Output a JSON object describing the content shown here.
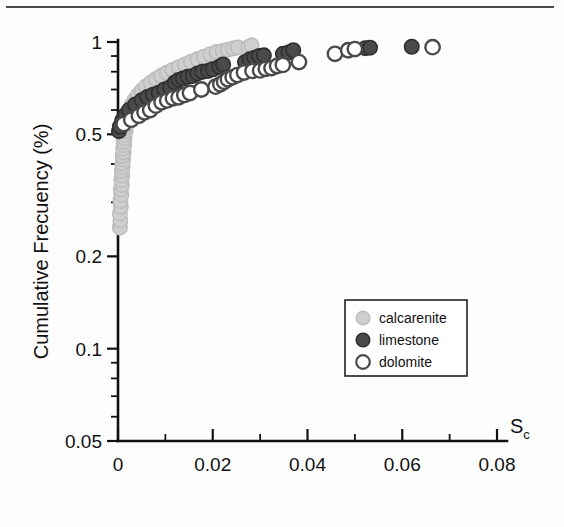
{
  "figure": {
    "background_color": "#fdfdfd",
    "top_rule_color": "#4a4a4a",
    "axis_color": "#111111"
  },
  "chart_data": {
    "type": "scatter",
    "title": "",
    "subtitle": "",
    "xlabel": "S",
    "xlabel_sub": "c",
    "ylabel": "Cumulative Frecuency (%)",
    "xlim": [
      0,
      0.08
    ],
    "ylim": [
      0.05,
      1
    ],
    "yscale": "log",
    "xscale": "linear",
    "grid": false,
    "legend_position": "center-right",
    "x_ticks": [
      0,
      0.02,
      0.04,
      0.06,
      0.08
    ],
    "x_tick_labels": [
      "0",
      "0.02",
      "0.04",
      "0.06",
      "0.08"
    ],
    "x_minor_ticks": [
      0.01,
      0.03,
      0.05,
      0.07
    ],
    "y_ticks": [
      1,
      0.5,
      0.2,
      0.1,
      0.05
    ],
    "y_tick_labels": [
      "1",
      "0.5",
      "0.2",
      "0.1",
      "0.05"
    ],
    "y_minor_ticks": [
      0.9,
      0.8,
      0.7,
      0.6,
      0.4,
      0.3,
      0.09,
      0.08,
      0.07,
      0.06
    ],
    "legend": [
      {
        "name": "calcarenite",
        "marker": "filled-circle",
        "color": "#cfcfcf",
        "edge": "#bdbdbd"
      },
      {
        "name": "limestone",
        "marker": "filled-circle",
        "color": "#4a4a4a",
        "edge": "#2e2e2e"
      },
      {
        "name": "dolomite",
        "marker": "open-circle",
        "color": "#ffffff",
        "edge": "#4a4a4a"
      }
    ],
    "series": [
      {
        "name": "calcarenite",
        "marker": "filled-circle",
        "color": "#cfcfcf",
        "edge": "#bdbdbd",
        "points": [
          [
            0.0004,
            0.248
          ],
          [
            0.0005,
            0.262
          ],
          [
            0.0004,
            0.276
          ],
          [
            0.0006,
            0.29
          ],
          [
            0.0005,
            0.303
          ],
          [
            0.0007,
            0.317
          ],
          [
            0.0006,
            0.33
          ],
          [
            0.0008,
            0.342
          ],
          [
            0.0007,
            0.355
          ],
          [
            0.0009,
            0.367
          ],
          [
            0.0008,
            0.379
          ],
          [
            0.001,
            0.391
          ],
          [
            0.0009,
            0.402
          ],
          [
            0.0011,
            0.414
          ],
          [
            0.001,
            0.425
          ],
          [
            0.0012,
            0.437
          ],
          [
            0.0011,
            0.449
          ],
          [
            0.0013,
            0.461
          ],
          [
            0.0012,
            0.473
          ],
          [
            0.0014,
            0.486
          ],
          [
            0.0013,
            0.498
          ],
          [
            0.0016,
            0.512
          ],
          [
            0.0015,
            0.524
          ],
          [
            0.0018,
            0.537
          ],
          [
            0.0017,
            0.55
          ],
          [
            0.0021,
            0.563
          ],
          [
            0.002,
            0.575
          ],
          [
            0.0025,
            0.588
          ],
          [
            0.0024,
            0.6
          ],
          [
            0.003,
            0.613
          ],
          [
            0.0029,
            0.624
          ],
          [
            0.0036,
            0.637
          ],
          [
            0.0035,
            0.648
          ],
          [
            0.0043,
            0.66
          ],
          [
            0.0042,
            0.671
          ],
          [
            0.0051,
            0.683
          ],
          [
            0.005,
            0.694
          ],
          [
            0.006,
            0.706
          ],
          [
            0.0059,
            0.716
          ],
          [
            0.007,
            0.727
          ],
          [
            0.0069,
            0.737
          ],
          [
            0.0081,
            0.748
          ],
          [
            0.008,
            0.757
          ],
          [
            0.0092,
            0.767
          ],
          [
            0.0091,
            0.776
          ],
          [
            0.0104,
            0.786
          ],
          [
            0.0103,
            0.794
          ],
          [
            0.0116,
            0.803
          ],
          [
            0.0115,
            0.811
          ],
          [
            0.0129,
            0.82
          ],
          [
            0.0128,
            0.828
          ],
          [
            0.0142,
            0.837
          ],
          [
            0.0141,
            0.845
          ],
          [
            0.0155,
            0.854
          ],
          [
            0.0154,
            0.862
          ],
          [
            0.0169,
            0.871
          ],
          [
            0.0168,
            0.879
          ],
          [
            0.0182,
            0.888
          ],
          [
            0.0181,
            0.896
          ],
          [
            0.0196,
            0.905
          ],
          [
            0.0195,
            0.912
          ],
          [
            0.0209,
            0.92
          ],
          [
            0.0208,
            0.927
          ],
          [
            0.0221,
            0.935
          ],
          [
            0.0232,
            0.944
          ],
          [
            0.0243,
            0.952
          ],
          [
            0.0253,
            0.96
          ],
          [
            0.0275,
            0.962
          ],
          [
            0.0282,
            0.975
          ]
        ]
      },
      {
        "name": "limestone",
        "marker": "filled-circle",
        "color": "#4a4a4a",
        "edge": "#2e2e2e",
        "points": [
          [
            0.0002,
            0.512
          ],
          [
            0.0004,
            0.53
          ],
          [
            0.0009,
            0.556
          ],
          [
            0.0016,
            0.58
          ],
          [
            0.0023,
            0.6
          ],
          [
            0.0036,
            0.625
          ],
          [
            0.005,
            0.646
          ],
          [
            0.0062,
            0.662
          ],
          [
            0.0074,
            0.673
          ],
          [
            0.0086,
            0.683
          ],
          [
            0.0098,
            0.7
          ],
          [
            0.011,
            0.712
          ],
          [
            0.012,
            0.738
          ],
          [
            0.0128,
            0.752
          ],
          [
            0.0137,
            0.76
          ],
          [
            0.0147,
            0.77
          ],
          [
            0.0158,
            0.775
          ],
          [
            0.0168,
            0.79
          ],
          [
            0.0178,
            0.8
          ],
          [
            0.019,
            0.805
          ],
          [
            0.02,
            0.815
          ],
          [
            0.0214,
            0.83
          ],
          [
            0.0222,
            0.845
          ],
          [
            0.0268,
            0.86
          ],
          [
            0.0278,
            0.878
          ],
          [
            0.0288,
            0.888
          ],
          [
            0.0298,
            0.9
          ],
          [
            0.0308,
            0.905
          ],
          [
            0.0348,
            0.915
          ],
          [
            0.036,
            0.925
          ],
          [
            0.037,
            0.94
          ],
          [
            0.0522,
            0.955
          ],
          [
            0.0532,
            0.958
          ],
          [
            0.062,
            0.965
          ]
        ]
      },
      {
        "name": "dolomite",
        "marker": "open-circle",
        "color": "#ffffff",
        "edge": "#4a4a4a",
        "points": [
          [
            0.0012,
            0.54
          ],
          [
            0.0028,
            0.558
          ],
          [
            0.0044,
            0.575
          ],
          [
            0.0056,
            0.59
          ],
          [
            0.0068,
            0.6
          ],
          [
            0.008,
            0.62
          ],
          [
            0.0092,
            0.636
          ],
          [
            0.0104,
            0.645
          ],
          [
            0.0116,
            0.655
          ],
          [
            0.0128,
            0.66
          ],
          [
            0.014,
            0.672
          ],
          [
            0.0152,
            0.682
          ],
          [
            0.0176,
            0.7
          ],
          [
            0.0206,
            0.715
          ],
          [
            0.0216,
            0.728
          ],
          [
            0.0224,
            0.742
          ],
          [
            0.0232,
            0.756
          ],
          [
            0.0242,
            0.768
          ],
          [
            0.0252,
            0.78
          ],
          [
            0.0266,
            0.795
          ],
          [
            0.0284,
            0.805
          ],
          [
            0.03,
            0.808
          ],
          [
            0.0312,
            0.818
          ],
          [
            0.0324,
            0.822
          ],
          [
            0.0336,
            0.835
          ],
          [
            0.0348,
            0.842
          ],
          [
            0.0382,
            0.86
          ],
          [
            0.0458,
            0.915
          ],
          [
            0.0486,
            0.94
          ],
          [
            0.05,
            0.948
          ],
          [
            0.0664,
            0.962
          ]
        ]
      }
    ]
  }
}
